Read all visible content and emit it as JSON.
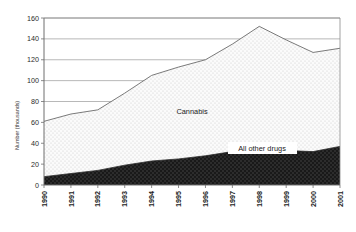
{
  "chart_data": {
    "type": "area",
    "title": "",
    "xlabel": "",
    "ylabel": "Number (thousands)",
    "categories": [
      "1990",
      "1991",
      "1992",
      "1993",
      "1994",
      "1995",
      "1996",
      "1997",
      "1998",
      "1999",
      "2000",
      "2001"
    ],
    "series": [
      {
        "name": "All other drugs",
        "values": [
          8,
          11,
          14,
          19,
          23,
          25,
          28,
          32,
          36,
          33,
          32,
          37
        ],
        "fill": "#1c1c1c",
        "pattern": "dark-dotted"
      },
      {
        "name": "Cannabis",
        "values": [
          53,
          57,
          58,
          69,
          82,
          88,
          92,
          103,
          116,
          106,
          95,
          94
        ],
        "fill": "#f4f4f4",
        "pattern": "light-dotted"
      }
    ],
    "totals": [
      61,
      68,
      72,
      88,
      105,
      113,
      120,
      135,
      152,
      139,
      127,
      131
    ],
    "ylim": [
      0,
      160
    ],
    "yticks": [
      0,
      20,
      40,
      60,
      80,
      100,
      120,
      140,
      160
    ],
    "ytick_labels": [
      "0",
      "20",
      "40",
      "60",
      "80",
      "100",
      "120",
      "140",
      "160"
    ],
    "grid": true,
    "grid_axis": "y",
    "legend": "inline-labels",
    "stacked": true,
    "annotations": [
      {
        "text": "Cannabis",
        "series": "Cannabis",
        "boxed": false
      },
      {
        "text": "All other drugs",
        "series": "All other drugs",
        "boxed": true
      }
    ]
  },
  "colors": {
    "plot_background": "#ffffff",
    "grid_line": "#9a9a9a",
    "axis_line": "#6e6e6e",
    "cannabis_fill": "#f4f4f4",
    "other_drugs_fill": "#1c1c1c",
    "outline": "#5a5a5a",
    "text": "#1a1a1a",
    "label_box_background": "#ffffff"
  }
}
